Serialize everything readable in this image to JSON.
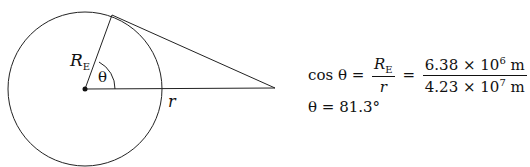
{
  "diagram": {
    "labels": {
      "radius": "R",
      "radius_sub": "E",
      "angle": "θ",
      "distance": "r"
    }
  },
  "equation1": {
    "lhs": "cos θ =",
    "frac1_num": "R",
    "frac1_num_sub": "E",
    "frac1_den": "r",
    "eq": "=",
    "frac2_num_a": "6.38 × 10",
    "frac2_num_exp": "6",
    "frac2_num_unit": " m",
    "frac2_den_a": "4.23 × 10",
    "frac2_den_exp": "7",
    "frac2_den_unit": " m"
  },
  "equation2": {
    "text": "θ = 81.3°"
  }
}
